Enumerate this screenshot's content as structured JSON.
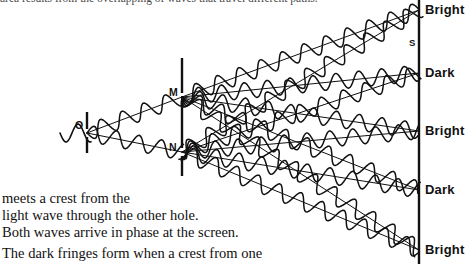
{
  "figure": {
    "caption_top_cut": "area results from the overlapping of waves that travel different paths.",
    "caption_lines": [
      "meets a crest from the",
      "light wave through the other hole.",
      "Both waves arrive in phase at the screen.",
      "The dark fringes form when a crest from one"
    ],
    "ink_color": "#111111",
    "background": "#ffffff"
  },
  "diagram": {
    "name": "youngs-double-slit-interference",
    "source_label": "O",
    "slit_labels": [
      "M",
      "N"
    ],
    "screen_point_label": "S",
    "screen_labels": [
      {
        "text": "Bright",
        "y": 10
      },
      {
        "text": "Dark",
        "y": 73
      },
      {
        "text": "Bright",
        "y": 131
      },
      {
        "text": "Dark",
        "y": 190
      },
      {
        "text": "Bright",
        "y": 250
      }
    ],
    "first_barrier": {
      "x": 87,
      "top": 112,
      "bottom": 153,
      "gap_top": 129,
      "gap_bottom": 137
    },
    "second_barrier": {
      "x": 182,
      "top": 58,
      "bottom": 176,
      "gap1": [
        93,
        101
      ],
      "gap2": [
        148,
        156
      ]
    },
    "screen": {
      "x": 419,
      "top": 0,
      "bottom": 264
    },
    "incoming_wave": {
      "start_x": 60,
      "y": 133,
      "amplitude": 9,
      "wavelength": 24
    },
    "rays_from_M": [
      {
        "label": "Bright",
        "end_y": 10
      },
      {
        "label": "Dark",
        "end_y": 73
      },
      {
        "label": "Bright",
        "end_y": 131
      },
      {
        "label": "Dark",
        "end_y": 190
      },
      {
        "label": "Bright",
        "end_y": 250
      }
    ],
    "rays_from_N": [
      {
        "label": "Bright",
        "end_y": 10
      },
      {
        "label": "Dark",
        "end_y": 73
      },
      {
        "label": "Bright",
        "end_y": 131
      },
      {
        "label": "Dark",
        "end_y": 190
      },
      {
        "label": "Bright",
        "end_y": 250
      }
    ],
    "wave_amplitude": 8,
    "wave_wavelength": 23
  }
}
